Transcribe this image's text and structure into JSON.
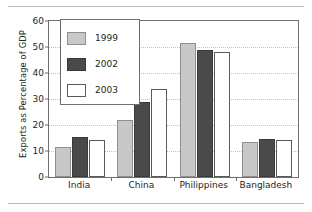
{
  "chart_data": {
    "type": "bar",
    "title": "",
    "subtitle": "",
    "xlabel": "",
    "ylabel": "Exports as Percentage of GDP",
    "ylim": [
      0,
      60
    ],
    "yticks": [
      0,
      10,
      20,
      30,
      40,
      50,
      60
    ],
    "ytick_labels": [
      "0",
      "10",
      "20",
      "30",
      "40",
      "50",
      "60"
    ],
    "grid": "horizontal-dotted",
    "legend_position": "inside-upper-left",
    "categories": [
      "India",
      "China",
      "Philippines",
      "Bangladesh"
    ],
    "series": [
      {
        "name": "1999",
        "color": "#c8c8c8",
        "values": [
          11.5,
          22.0,
          51.5,
          13.5
        ]
      },
      {
        "name": "2002",
        "color": "#4a4a4a",
        "values": [
          15.2,
          29.0,
          49.0,
          14.5
        ]
      },
      {
        "name": "2003",
        "color": "#ffffff",
        "values": [
          14.3,
          34.0,
          48.0,
          14.2
        ]
      }
    ]
  },
  "legend": {
    "items": [
      {
        "label": "1999"
      },
      {
        "label": "2002"
      },
      {
        "label": "2003"
      }
    ]
  },
  "colors": {
    "series_1999": "#c8c8c8",
    "series_2002": "#4a4a4a",
    "series_2003": "#ffffff",
    "axis": "#6f6f6f",
    "grid": "#c2c2c2",
    "text": "#231f20",
    "rule": "#b9b9b9"
  }
}
